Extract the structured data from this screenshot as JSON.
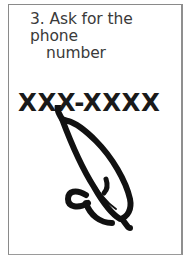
{
  "card": {
    "step_number": "3.",
    "step_text_line1": "Ask for the phone",
    "step_text_line2": "number",
    "phone_number_placeholder": "XXX-XXXX"
  },
  "illustration": {
    "icon": "telephone-handset-icon",
    "color": "#111111"
  },
  "colors": {
    "background": "#ffffff",
    "border": "#8a8a8a",
    "text": "#3a3a3a"
  }
}
